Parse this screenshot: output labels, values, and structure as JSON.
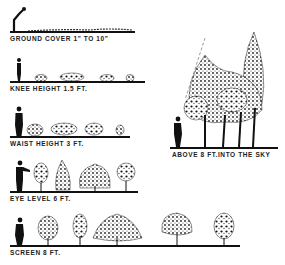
{
  "levels": [
    {
      "id": "ground-cover",
      "label": "GROUND COVER 1\" TO 10\""
    },
    {
      "id": "knee-height",
      "label": "KNEE HEIGHT 1.5 FT."
    },
    {
      "id": "waist-height",
      "label": "WAIST HEIGHT 3 FT."
    },
    {
      "id": "eye-level",
      "label": "EYE LEVEL 6 FT."
    },
    {
      "id": "screen",
      "label": "SCREEN 8 FT."
    },
    {
      "id": "above-8ft",
      "label": "ABOVE 8 FT.INTO THE SKY"
    }
  ],
  "colors": {
    "ink": "#111111",
    "background": "#ffffff"
  }
}
